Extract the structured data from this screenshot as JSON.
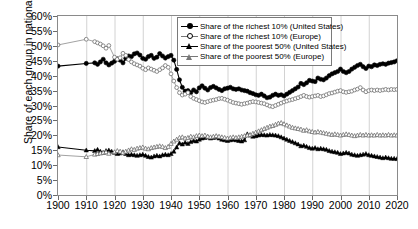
{
  "chart_data": {
    "type": "line",
    "title": "",
    "xlabel": "",
    "ylabel": "Share of each group in national income",
    "xlim": [
      1900,
      2020
    ],
    "ylim": [
      0,
      60
    ],
    "grid": "vertical-only",
    "legend_position": "top-center",
    "ytick_labels": [
      "0%",
      "5%",
      "10%",
      "15%",
      "20%",
      "25%",
      "30%",
      "35%",
      "40%",
      "45%",
      "50%",
      "55%",
      "60%"
    ],
    "ytick_values": [
      0,
      5,
      10,
      15,
      20,
      25,
      30,
      35,
      40,
      45,
      50,
      55,
      60
    ],
    "xtick_labels": [
      "1900",
      "1910",
      "1920",
      "1930",
      "1940",
      "1950",
      "1960",
      "1970",
      "1980",
      "1990",
      "2000",
      "2010",
      "2020"
    ],
    "xtick_values": [
      1900,
      1910,
      1920,
      1930,
      1940,
      1950,
      1960,
      1970,
      1980,
      1990,
      2000,
      2010,
      2020
    ],
    "series": [
      {
        "name": "Share of the richest 10% (United States)",
        "marker": "filled-circle",
        "color": "#000000",
        "x": [
          1900,
          1910,
          1913,
          1914,
          1915,
          1916,
          1917,
          1918,
          1919,
          1920,
          1921,
          1922,
          1923,
          1924,
          1925,
          1926,
          1927,
          1928,
          1929,
          1930,
          1931,
          1932,
          1933,
          1934,
          1935,
          1936,
          1937,
          1938,
          1939,
          1940,
          1941,
          1942,
          1943,
          1944,
          1945,
          1946,
          1947,
          1948,
          1949,
          1950,
          1951,
          1952,
          1953,
          1954,
          1955,
          1956,
          1957,
          1958,
          1959,
          1960,
          1961,
          1962,
          1963,
          1964,
          1965,
          1966,
          1967,
          1968,
          1969,
          1970,
          1971,
          1972,
          1973,
          1974,
          1975,
          1976,
          1977,
          1978,
          1979,
          1980,
          1981,
          1982,
          1983,
          1984,
          1985,
          1986,
          1987,
          1988,
          1989,
          1990,
          1991,
          1992,
          1993,
          1994,
          1995,
          1996,
          1997,
          1998,
          1999,
          2000,
          2001,
          2002,
          2003,
          2004,
          2005,
          2006,
          2007,
          2008,
          2009,
          2010,
          2011,
          2012,
          2013,
          2014,
          2015,
          2016,
          2017,
          2018,
          2019,
          2020
        ],
        "y": [
          43.2,
          44.1,
          44.3,
          43.8,
          44.6,
          45.5,
          44.3,
          43.6,
          44.2,
          44.8,
          45.6,
          45.2,
          44.3,
          45.8,
          46.6,
          46.4,
          47.3,
          47.6,
          46.9,
          45.8,
          45.5,
          46.4,
          46.8,
          45.8,
          46.2,
          47.4,
          46.6,
          45.9,
          46.4,
          46.8,
          45.2,
          42.1,
          38.6,
          36.1,
          34.8,
          35.0,
          34.3,
          35.2,
          34.6,
          35.9,
          36.6,
          35.8,
          35.2,
          36.0,
          36.4,
          35.9,
          35.4,
          35.0,
          35.6,
          35.8,
          36.1,
          35.6,
          35.4,
          35.6,
          35.2,
          35.0,
          34.8,
          34.3,
          34.0,
          33.6,
          33.4,
          33.8,
          33.2,
          32.6,
          32.8,
          33.4,
          33.8,
          33.4,
          33.6,
          33.2,
          33.8,
          34.4,
          35.0,
          35.6,
          36.2,
          37.4,
          37.0,
          37.6,
          38.4,
          38.2,
          38.0,
          39.2,
          38.8,
          38.6,
          39.2,
          40.0,
          40.6,
          41.0,
          41.4,
          42.2,
          41.4,
          41.0,
          41.4,
          42.2,
          42.8,
          43.4,
          43.8,
          43.0,
          42.4,
          43.2,
          43.0,
          43.6,
          43.4,
          43.8,
          44.0,
          43.8,
          44.2,
          44.4,
          44.6,
          45.0
        ]
      },
      {
        "name": "Share of the richest 10% (Europe)",
        "marker": "open-circle",
        "color": "#777777",
        "x": [
          1900,
          1910,
          1913,
          1914,
          1915,
          1916,
          1917,
          1918,
          1920,
          1921,
          1922,
          1923,
          1924,
          1925,
          1926,
          1927,
          1928,
          1929,
          1930,
          1931,
          1932,
          1933,
          1934,
          1935,
          1936,
          1937,
          1938,
          1939,
          1940,
          1941,
          1942,
          1943,
          1944,
          1945,
          1946,
          1947,
          1948,
          1949,
          1950,
          1951,
          1952,
          1953,
          1954,
          1955,
          1956,
          1957,
          1958,
          1959,
          1960,
          1961,
          1962,
          1963,
          1964,
          1965,
          1966,
          1967,
          1968,
          1969,
          1970,
          1971,
          1972,
          1973,
          1974,
          1975,
          1976,
          1977,
          1978,
          1979,
          1980,
          1981,
          1982,
          1983,
          1984,
          1985,
          1986,
          1987,
          1988,
          1989,
          1990,
          1991,
          1992,
          1993,
          1994,
          1995,
          1996,
          1997,
          1998,
          1999,
          2000,
          2001,
          2002,
          2003,
          2004,
          2005,
          2006,
          2007,
          2008,
          2009,
          2010,
          2011,
          2012,
          2013,
          2014,
          2015,
          2016,
          2017,
          2018,
          2019,
          2020
        ],
        "y": [
          50.3,
          52.2,
          51.4,
          51.0,
          50.6,
          50.0,
          49.2,
          50.1,
          46.2,
          45.5,
          46.0,
          47.5,
          46.8,
          45.4,
          44.6,
          44.0,
          43.6,
          43.2,
          42.5,
          42.0,
          42.6,
          42.2,
          41.8,
          41.4,
          42.0,
          42.6,
          43.4,
          42.8,
          40.6,
          38.2,
          36.0,
          34.3,
          33.5,
          33.8,
          34.3,
          33.0,
          32.4,
          32.0,
          31.6,
          31.2,
          31.0,
          31.3,
          31.6,
          31.8,
          32.0,
          32.3,
          32.4,
          32.1,
          31.8,
          31.4,
          31.0,
          30.8,
          30.6,
          30.4,
          30.6,
          30.8,
          31.1,
          31.3,
          31.2,
          31.0,
          30.8,
          30.6,
          30.2,
          29.8,
          29.6,
          30.0,
          30.4,
          30.8,
          31.2,
          31.5,
          31.8,
          32.0,
          32.3,
          32.6,
          33.0,
          33.4,
          33.0,
          32.8,
          33.0,
          33.2,
          33.4,
          33.0,
          33.2,
          33.6,
          34.0,
          34.2,
          34.5,
          34.8,
          35.0,
          34.6,
          34.4,
          34.6,
          34.8,
          35.2,
          35.5,
          36.0,
          35.2,
          34.6,
          35.0,
          35.2,
          35.0,
          35.2,
          35.0,
          35.2,
          35.4,
          35.2,
          35.4,
          35.3,
          35.4
        ]
      },
      {
        "name": "Share of the poorest 50% (United States)",
        "marker": "filled-triangle",
        "color": "#000000",
        "x": [
          1900,
          1910,
          1913,
          1914,
          1915,
          1916,
          1917,
          1918,
          1919,
          1920,
          1921,
          1922,
          1923,
          1924,
          1925,
          1926,
          1927,
          1928,
          1929,
          1930,
          1931,
          1932,
          1933,
          1934,
          1935,
          1936,
          1937,
          1938,
          1939,
          1940,
          1941,
          1942,
          1943,
          1944,
          1945,
          1946,
          1947,
          1948,
          1949,
          1950,
          1951,
          1952,
          1953,
          1954,
          1955,
          1956,
          1957,
          1958,
          1959,
          1960,
          1961,
          1962,
          1963,
          1964,
          1965,
          1966,
          1967,
          1968,
          1969,
          1970,
          1971,
          1972,
          1973,
          1974,
          1975,
          1976,
          1977,
          1978,
          1979,
          1980,
          1981,
          1982,
          1983,
          1984,
          1985,
          1986,
          1987,
          1988,
          1989,
          1990,
          1991,
          1992,
          1993,
          1994,
          1995,
          1996,
          1997,
          1998,
          1999,
          2000,
          2001,
          2002,
          2003,
          2004,
          2005,
          2006,
          2007,
          2008,
          2009,
          2010,
          2011,
          2012,
          2013,
          2014,
          2015,
          2016,
          2017,
          2018,
          2019,
          2020
        ],
        "y": [
          16.1,
          15.0,
          14.8,
          15.2,
          14.6,
          14.2,
          14.8,
          15.0,
          14.6,
          14.2,
          13.8,
          14.0,
          14.4,
          13.8,
          13.4,
          13.6,
          13.4,
          13.2,
          13.4,
          13.6,
          13.2,
          12.8,
          12.6,
          13.0,
          13.2,
          13.0,
          13.4,
          13.6,
          13.4,
          13.8,
          14.6,
          16.0,
          17.4,
          17.0,
          17.6,
          17.2,
          17.8,
          18.2,
          18.0,
          18.6,
          19.0,
          19.2,
          19.4,
          19.0,
          19.2,
          19.4,
          19.0,
          18.6,
          18.4,
          18.2,
          18.4,
          18.6,
          18.4,
          18.2,
          18.0,
          18.4,
          20.4,
          20.0,
          19.6,
          19.8,
          20.0,
          20.2,
          20.1,
          20.0,
          20.2,
          20.1,
          20.0,
          19.8,
          19.4,
          19.0,
          18.6,
          18.2,
          17.8,
          17.4,
          17.0,
          16.4,
          16.6,
          16.2,
          15.8,
          15.6,
          15.8,
          15.4,
          15.6,
          15.4,
          15.2,
          14.8,
          14.6,
          14.4,
          14.2,
          13.8,
          14.0,
          14.2,
          14.0,
          13.6,
          13.4,
          13.2,
          13.4,
          13.6,
          13.8,
          13.4,
          13.2,
          13.0,
          12.8,
          12.6,
          12.4,
          12.6,
          12.4,
          12.2,
          12.2,
          12.1
        ]
      },
      {
        "name": "Share of the poorest 50% (Europe)",
        "marker": "open-triangle",
        "color": "#777777",
        "x": [
          1900,
          1910,
          1913,
          1914,
          1915,
          1916,
          1917,
          1918,
          1920,
          1921,
          1922,
          1923,
          1924,
          1925,
          1926,
          1927,
          1928,
          1929,
          1930,
          1931,
          1932,
          1933,
          1934,
          1935,
          1936,
          1937,
          1938,
          1939,
          1940,
          1941,
          1942,
          1943,
          1944,
          1945,
          1946,
          1947,
          1948,
          1949,
          1950,
          1951,
          1952,
          1953,
          1954,
          1955,
          1956,
          1957,
          1958,
          1959,
          1960,
          1961,
          1962,
          1963,
          1964,
          1965,
          1966,
          1967,
          1968,
          1969,
          1970,
          1971,
          1972,
          1973,
          1974,
          1975,
          1976,
          1977,
          1978,
          1979,
          1980,
          1981,
          1982,
          1983,
          1984,
          1985,
          1986,
          1987,
          1988,
          1989,
          1990,
          1991,
          1992,
          1993,
          1994,
          1995,
          1996,
          1997,
          1998,
          1999,
          2000,
          2001,
          2002,
          2003,
          2004,
          2005,
          2006,
          2007,
          2008,
          2009,
          2010,
          2011,
          2012,
          2013,
          2014,
          2015,
          2016,
          2017,
          2018,
          2019,
          2020
        ],
        "y": [
          13.4,
          12.8,
          13.6,
          13.8,
          14.0,
          14.2,
          14.4,
          13.9,
          14.4,
          14.8,
          14.6,
          14.2,
          14.6,
          15.0,
          15.4,
          15.2,
          15.6,
          15.8,
          16.0,
          15.6,
          15.4,
          15.8,
          16.0,
          16.2,
          16.4,
          16.2,
          15.8,
          16.2,
          17.2,
          18.0,
          18.6,
          19.2,
          19.4,
          19.0,
          19.2,
          19.6,
          19.4,
          19.8,
          20.0,
          19.8,
          20.0,
          19.6,
          19.4,
          19.6,
          19.8,
          19.6,
          19.4,
          19.2,
          19.0,
          19.2,
          19.4,
          19.2,
          19.4,
          19.6,
          19.8,
          20.0,
          20.2,
          20.6,
          21.0,
          21.4,
          21.8,
          22.2,
          22.6,
          23.0,
          23.2,
          23.6,
          24.0,
          24.2,
          23.8,
          23.4,
          23.0,
          22.6,
          22.4,
          22.2,
          22.0,
          21.6,
          21.8,
          21.4,
          21.2,
          21.0,
          21.2,
          21.0,
          20.8,
          20.6,
          20.4,
          20.2,
          20.4,
          20.2,
          20.0,
          20.2,
          20.4,
          20.2,
          20.0,
          19.8,
          20.0,
          20.2,
          20.0,
          20.2,
          20.0,
          20.1,
          20.0,
          20.2,
          20.0,
          20.1,
          20.0,
          20.2,
          20.0,
          20.1,
          20.0
        ]
      }
    ]
  },
  "legend": {
    "items": [
      {
        "label": "Share of the richest 10% (United States)",
        "marker": "filled-circle"
      },
      {
        "label": "Share of the richest 10% (Europe)",
        "marker": "open-circle"
      },
      {
        "label": "Share of the poorest 50% (United States)",
        "marker": "filled-triangle"
      },
      {
        "label": "Share of the poorest 50% (Europe)",
        "marker": "open-triangle"
      }
    ]
  }
}
